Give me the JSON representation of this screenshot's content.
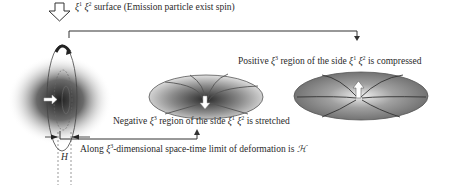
{
  "labels": {
    "surface": {
      "symbol": "ξ",
      "sup1": "1",
      "sup2": "2",
      "text": "surface (Emission particle exist spin)"
    },
    "positive": {
      "prefix": "Positive ",
      "symbol": "ξ",
      "sup": "3",
      "mid": " region of the side ",
      "sym2": "ξ",
      "sup2": "1",
      "sym3": "ξ",
      "sup3": "2",
      "suffix": " is compressed"
    },
    "negative": {
      "prefix": "Negative ",
      "symbol": "ξ",
      "sup": "3",
      "mid": " region of the side ",
      "sym2": "ξ",
      "sup2": "1",
      "sym3": "ξ",
      "sup3": "2",
      "suffix": " is stretched"
    },
    "along": {
      "prefix": "Along  ",
      "symbol": "ξ",
      "sup": "3",
      "text": "-dimensional space-time limit of deformation is ",
      "script": "ℋ"
    },
    "h": "H"
  },
  "icons": {
    "emission-arrow": "hollow-down-arrow",
    "spin-arrow": "curved-arrow",
    "inner-arrow": "hollow-right-arrow",
    "stretch-arrow": "hollow-down-arrow",
    "compress-arrow": "hollow-up-arrow"
  },
  "colors": {
    "line": "#333333",
    "shade-dark": "#3a3a3a",
    "shade-light": "#e0e0e0"
  }
}
